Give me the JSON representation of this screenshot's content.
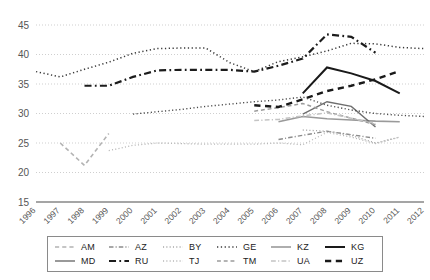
{
  "chart_data": {
    "type": "line",
    "title": "",
    "subtitle": "",
    "xlabel": "",
    "ylabel": "",
    "xlim": [
      1996,
      2012
    ],
    "ylim": [
      15,
      45
    ],
    "grid": true,
    "legend_position": "bottom",
    "x": [
      1996,
      1997,
      1998,
      1999,
      2000,
      2001,
      2002,
      2003,
      2004,
      2005,
      2006,
      2007,
      2008,
      2009,
      2010,
      2011,
      2012
    ],
    "xticklabels": [
      "1996",
      "1997",
      "1998",
      "1999",
      "2000",
      "2001",
      "2002",
      "2003",
      "2004",
      "2005",
      "2006",
      "2007",
      "2008",
      "2009",
      "2010",
      "2011",
      "2012"
    ],
    "yticks": [
      15,
      20,
      25,
      30,
      35,
      40,
      45
    ],
    "yticklabels": [
      "15",
      "20",
      "25",
      "30",
      "35",
      "40",
      "45"
    ],
    "series": [
      {
        "name": "AM",
        "style": "dashed",
        "color": "#b3b3b3",
        "width": 1.6,
        "x": [
          1997,
          1998,
          1999
        ],
        "values": [
          25.0,
          21.2,
          26.6
        ]
      },
      {
        "name": "AZ",
        "style": "dashdot",
        "color": "#8c8c8c",
        "width": 1.4,
        "x": [
          2006,
          2007,
          2008,
          2009,
          2010
        ],
        "values": [
          25.6,
          26.3,
          27.0,
          26.4,
          25.8
        ]
      },
      {
        "name": "BY",
        "style": "dotted",
        "color": "#a8a8a8",
        "width": 1.3,
        "x": [
          2007,
          2008,
          2009,
          2010,
          2011
        ],
        "values": [
          27.2,
          27.0,
          26.3,
          25.0,
          26.0
        ]
      },
      {
        "name": "GE",
        "style": "dotted",
        "color": "#3a3a3a",
        "width": 1.5,
        "x": [
          1996,
          1997,
          1998,
          1999,
          2000,
          2001,
          2002,
          2003,
          2004,
          2005,
          2006,
          2007,
          2008,
          2009,
          2010,
          2011,
          2012
        ],
        "values": [
          37.1,
          36.2,
          37.5,
          38.7,
          40.2,
          41.0,
          41.1,
          41.1,
          38.6,
          37.1,
          38.8,
          39.6,
          40.6,
          41.9,
          41.8,
          41.2,
          41.0
        ]
      },
      {
        "name": "KZ",
        "style": "solid",
        "color": "#9a9a9a",
        "width": 1.6,
        "x": [
          2006,
          2007,
          2008,
          2009,
          2010,
          2011
        ],
        "values": [
          28.6,
          29.5,
          29.1,
          28.9,
          28.7,
          28.6
        ]
      },
      {
        "name": "KG",
        "style": "solid",
        "color": "#1a1a1a",
        "width": 2.0,
        "x": [
          2007,
          2008,
          2009,
          2010,
          2011
        ],
        "values": [
          33.4,
          37.8,
          36.8,
          35.5,
          33.4
        ]
      },
      {
        "name": "MD",
        "style": "solid",
        "color": "#6e6e6e",
        "width": 1.4,
        "x": [
          2007,
          2008,
          2009,
          2010
        ],
        "values": [
          29.9,
          32.0,
          31.2,
          27.7
        ]
      },
      {
        "name": "RU",
        "style": "dashdot",
        "color": "#1c1c1c",
        "width": 2.2,
        "x": [
          1998,
          1999,
          2000,
          2001,
          2002,
          2003,
          2004,
          2005,
          2006,
          2007,
          2008,
          2009,
          2010
        ],
        "values": [
          34.7,
          34.7,
          36.2,
          37.3,
          37.4,
          37.4,
          37.4,
          37.1,
          38.1,
          39.3,
          43.4,
          43.0,
          40.3
        ]
      },
      {
        "name": "TJ",
        "style": "dotted",
        "color": "#b8b8b8",
        "width": 1.3,
        "x": [
          1999,
          2000,
          2001,
          2002,
          2003,
          2004,
          2005,
          2006,
          2007,
          2008,
          2009,
          2010,
          2011
        ],
        "values": [
          23.7,
          24.6,
          25.0,
          24.9,
          24.8,
          24.8,
          24.8,
          25.0,
          24.7,
          26.8,
          26.0,
          24.9,
          26.0
        ]
      },
      {
        "name": "TM",
        "style": "dashed",
        "color": "#9c9c9c",
        "width": 1.5,
        "x": [
          2005,
          2006,
          2007,
          2008,
          2009,
          2010
        ],
        "values": [
          30.4,
          31.0,
          31.7,
          30.3,
          29.2,
          28.1
        ]
      },
      {
        "name": "UA",
        "style": "dashdot",
        "color": "#c4c4c4",
        "width": 1.5,
        "x": [
          2005,
          2006,
          2007,
          2008,
          2009,
          2010
        ],
        "values": [
          28.8,
          29.0,
          29.6,
          30.1,
          29.2,
          28.3
        ]
      },
      {
        "name": "UZ",
        "style": "dashed",
        "color": "#1a1a1a",
        "width": 2.4,
        "x": [
          2005,
          2006,
          2007,
          2008,
          2009,
          2010,
          2011
        ],
        "values": [
          31.4,
          31.1,
          32.4,
          33.8,
          34.7,
          35.8,
          37.2
        ]
      },
      {
        "name": "BY-early",
        "style": "dotted",
        "color": "#4a4a4a",
        "width": 1.4,
        "x": [
          2000,
          2001,
          2002,
          2003,
          2004,
          2005,
          2006,
          2007,
          2008,
          2009,
          2010,
          2011,
          2012
        ],
        "values": [
          29.9,
          30.3,
          30.7,
          31.2,
          31.6,
          32.0,
          32.3,
          32.8,
          31.4,
          30.6,
          30.0,
          29.7,
          29.5
        ]
      }
    ]
  },
  "legend": {
    "items": [
      {
        "label": "AM",
        "style": "dashed",
        "color": "#b3b3b3",
        "width": 1.6
      },
      {
        "label": "AZ",
        "style": "dashdot",
        "color": "#8c8c8c",
        "width": 1.4
      },
      {
        "label": "BY",
        "style": "dotted",
        "color": "#a8a8a8",
        "width": 1.3
      },
      {
        "label": "GE",
        "style": "dotted",
        "color": "#3a3a3a",
        "width": 1.5
      },
      {
        "label": "KZ",
        "style": "solid",
        "color": "#9a9a9a",
        "width": 1.6
      },
      {
        "label": "KG",
        "style": "solid",
        "color": "#1a1a1a",
        "width": 2.0
      },
      {
        "label": "MD",
        "style": "solid",
        "color": "#6e6e6e",
        "width": 1.4
      },
      {
        "label": "RU",
        "style": "dashdot",
        "color": "#1c1c1c",
        "width": 2.2
      },
      {
        "label": "TJ",
        "style": "dotted",
        "color": "#b8b8b8",
        "width": 1.3
      },
      {
        "label": "TM",
        "style": "dashed",
        "color": "#9c9c9c",
        "width": 1.5
      },
      {
        "label": "UA",
        "style": "dashdot",
        "color": "#c4c4c4",
        "width": 1.5
      },
      {
        "label": "UZ",
        "style": "dashed",
        "color": "#1a1a1a",
        "width": 2.4
      }
    ]
  },
  "axes": {
    "grid_color": "#c9c9c9",
    "axis_color": "#4d4d4d",
    "tick_color": "#555555"
  }
}
